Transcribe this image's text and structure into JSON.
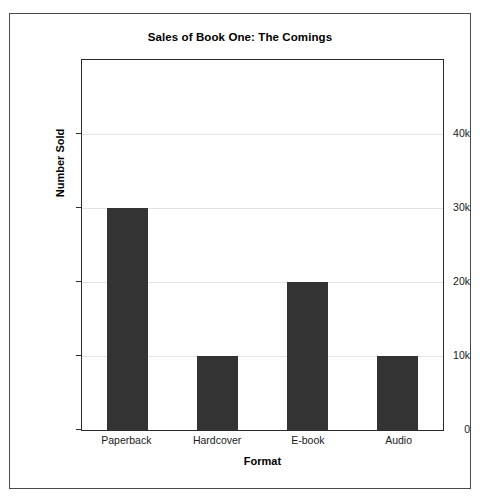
{
  "chart_data": {
    "type": "bar",
    "title": "Sales of Book One: The Comings",
    "xlabel": "Format",
    "ylabel": "Number Sold",
    "categories": [
      "Paperback",
      "Hardcover",
      "E-book",
      "Audio"
    ],
    "values": [
      30000,
      10000,
      20000,
      10000
    ],
    "ylim": [
      0,
      50000
    ],
    "ytick_values": [
      0,
      10000,
      20000,
      30000,
      40000
    ],
    "ytick_labels": [
      "0",
      "10k",
      "20k",
      "30k",
      "40k"
    ],
    "grid": true,
    "legend": false,
    "series": [
      {
        "name": "Number Sold",
        "values": [
          30000,
          10000,
          20000,
          10000
        ],
        "color": "#333333"
      }
    ],
    "colors": {
      "bar": "#333333",
      "grid": "#e3e3e3",
      "axis": "#2b2b2b",
      "frame": "#4a4a4a",
      "text": "#000000",
      "background": "#ffffff"
    }
  }
}
